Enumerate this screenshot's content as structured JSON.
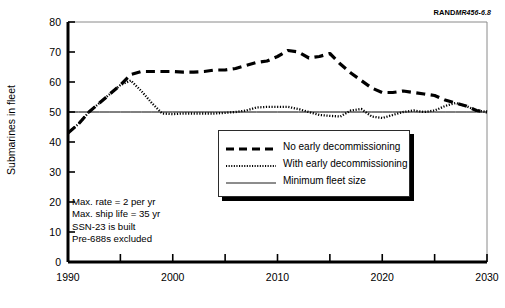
{
  "figure": {
    "rand_prefix": "RAND",
    "rand_number": "MR456-6.8",
    "ylabel": "Submarines in fleet"
  },
  "annotations": {
    "lines": [
      "Max. rate = 2 per yr",
      "Max. ship life = 35 yr",
      "SSN-23 is built",
      "Pre-688s excluded"
    ]
  },
  "legend": {
    "items": [
      {
        "label": "No early decommissioning",
        "style": "dashed"
      },
      {
        "label": "With early decommissioning",
        "style": "dotted"
      },
      {
        "label": "Minimum fleet size",
        "style": "solid"
      }
    ]
  },
  "chart_data": {
    "type": "line",
    "title": "",
    "xlabel": "",
    "ylabel": "Submarines in fleet",
    "xlim": [
      1990,
      2030
    ],
    "ylim": [
      0,
      80
    ],
    "xticks": [
      1990,
      2000,
      2010,
      2020,
      2030
    ],
    "xminorticks": [
      1995,
      2005,
      2015,
      2025
    ],
    "yticks": [
      0,
      10,
      20,
      30,
      40,
      50,
      60,
      70,
      80
    ],
    "grid": false,
    "legend_position": "center",
    "x": [
      1990,
      1991,
      1992,
      1993,
      1994,
      1995,
      1996,
      1997,
      1998,
      1999,
      2000,
      2001,
      2002,
      2003,
      2004,
      2005,
      2006,
      2007,
      2008,
      2009,
      2010,
      2011,
      2012,
      2013,
      2014,
      2015,
      2016,
      2017,
      2018,
      2019,
      2020,
      2021,
      2022,
      2023,
      2024,
      2025,
      2026,
      2027,
      2028,
      2029,
      2030
    ],
    "series": [
      {
        "name": "No early decommissioning",
        "style": "dashed",
        "values": [
          43,
          46,
          50,
          53,
          56,
          59,
          62.5,
          63.5,
          63.5,
          63.5,
          63.5,
          63.3,
          63.3,
          63.5,
          64,
          64,
          64.5,
          65.5,
          66.5,
          67,
          68.5,
          70.5,
          70,
          68,
          68.5,
          69.5,
          66,
          63,
          60.5,
          58,
          56.5,
          56.5,
          57,
          56.5,
          56,
          55.5,
          54,
          53,
          52,
          50.5,
          50
        ]
      },
      {
        "name": "With early decommissioning",
        "style": "dotted",
        "values": [
          43,
          46,
          50,
          53,
          56,
          59,
          60.5,
          57,
          53,
          49.5,
          49.3,
          49.5,
          49.5,
          49.5,
          49.5,
          49.7,
          50,
          50.5,
          51.5,
          51.7,
          51.7,
          51.7,
          51,
          50,
          49,
          48.7,
          48.5,
          50.5,
          51,
          48.5,
          48,
          49,
          50,
          50.5,
          50,
          50.5,
          52,
          53,
          52,
          50.5,
          50
        ]
      },
      {
        "name": "Minimum fleet size",
        "style": "solid",
        "values": [
          50,
          50,
          50,
          50,
          50,
          50,
          50,
          50,
          50,
          50,
          50,
          50,
          50,
          50,
          50,
          50,
          50,
          50,
          50,
          50,
          50,
          50,
          50,
          50,
          50,
          50,
          50,
          50,
          50,
          50,
          50,
          50,
          50,
          50,
          50,
          50,
          50,
          50,
          50,
          50,
          50
        ]
      }
    ]
  }
}
